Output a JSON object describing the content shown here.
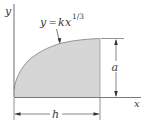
{
  "figure": {
    "equation": {
      "lhs": "y",
      "eq": "=",
      "coef": "k",
      "var": "x",
      "exponent": "1/3"
    },
    "axes": {
      "x_label": "x",
      "y_label": "y"
    },
    "dimensions": {
      "height_label": "a",
      "width_label": "h"
    },
    "colors": {
      "fill": "#d6d6d6",
      "stroke": "#555555",
      "axis": "#7a7a7a"
    }
  }
}
